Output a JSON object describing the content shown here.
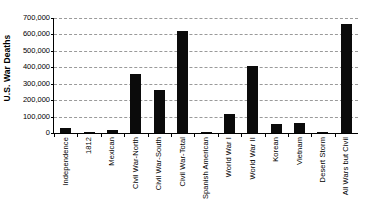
{
  "chart_data": {
    "type": "bar",
    "title": "",
    "xlabel": "",
    "ylabel": "U.S. War Deaths",
    "ylim": [
      0,
      700000
    ],
    "ytick_labels": [
      "700,000",
      "600,000",
      "500,000",
      "400,000",
      "300,000",
      "200,000",
      "100,000",
      "0"
    ],
    "ytick_values": [
      700000,
      600000,
      500000,
      400000,
      300000,
      200000,
      100000,
      0
    ],
    "grid": true,
    "legend": "none",
    "bar_color": "#0b0b0b",
    "grid_color": "#9a9a9a",
    "axis_color": "#000000",
    "categories": [
      "Independence",
      "1812",
      "Mexican",
      "Civil War-North",
      "Civil War-South",
      "Civil War-Total",
      "Spanish American",
      "World War I",
      "World War II",
      "Korean",
      "Vietnam",
      "Desert Storm",
      "All Wars but Civil"
    ],
    "values": [
      30000,
      8000,
      17000,
      360000,
      260000,
      620000,
      4000,
      116000,
      405000,
      54000,
      58000,
      400,
      665000
    ]
  }
}
